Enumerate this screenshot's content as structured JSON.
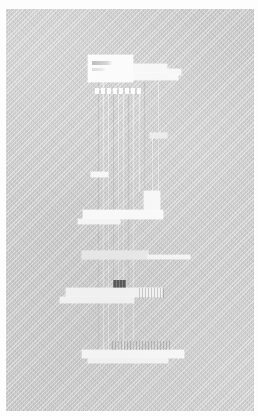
{
  "app": {
    "title": "",
    "view_mode": "canvas",
    "canvas_label": "",
    "background_color": "#c9c9c9",
    "panel_color": "#f7f7f7",
    "selection_color": "#4c4c4c",
    "margin_color": "#ffffff"
  },
  "canvas": {
    "zoom": "",
    "connector_color": "#ffffff",
    "note": ""
  },
  "nodes": [
    {
      "id": "node-top",
      "name": "primary-panel",
      "label": "",
      "title_text": "",
      "state": "normal",
      "x": 88,
      "y": 55,
      "w": 45,
      "h": 27
    },
    {
      "id": "node-top-wing-a",
      "name": "primary-panel-extension-a",
      "label": "",
      "state": "normal",
      "x": 133,
      "y": 64,
      "w": 34,
      "h": 9
    },
    {
      "id": "node-top-wing-b",
      "name": "primary-panel-extension-b",
      "label": "",
      "state": "normal",
      "x": 133,
      "y": 73,
      "w": 45,
      "h": 7
    },
    {
      "id": "node-top-wing-c",
      "name": "primary-panel-extension-c",
      "label": "",
      "state": "normal",
      "x": 167,
      "y": 69,
      "w": 14,
      "h": 6
    },
    {
      "id": "node-top-labels",
      "name": "primary-panel-label-row",
      "label": "",
      "state": "normal",
      "x": 95,
      "y": 88,
      "w": 48,
      "h": 6
    },
    {
      "id": "node-tag-mid",
      "name": "floating-tag",
      "label": "",
      "state": "normal",
      "x": 150,
      "y": 133,
      "w": 17,
      "h": 5
    },
    {
      "id": "node-tag-left",
      "name": "secondary-tag",
      "label": "",
      "state": "normal",
      "x": 91,
      "y": 172,
      "w": 17,
      "h": 5
    },
    {
      "id": "node-stack-tower",
      "name": "stacked-panel-tower",
      "label": "",
      "state": "normal",
      "x": 144,
      "y": 191,
      "w": 16,
      "h": 22
    },
    {
      "id": "node-stack-bar",
      "name": "stacked-panel-bar",
      "label": "",
      "state": "normal",
      "x": 83,
      "y": 210,
      "w": 80,
      "h": 9
    },
    {
      "id": "node-stack-foot",
      "name": "stacked-panel-footer",
      "label": "",
      "state": "normal",
      "x": 78,
      "y": 219,
      "w": 42,
      "h": 5
    },
    {
      "id": "node-wide-upper",
      "name": "wide-panel-upper",
      "label": "",
      "state": "normal",
      "x": 82,
      "y": 251,
      "w": 66,
      "h": 8
    },
    {
      "id": "node-wide-upper-tail",
      "name": "wide-panel-upper-tail",
      "label": "",
      "state": "normal",
      "x": 148,
      "y": 255,
      "w": 42,
      "h": 4
    },
    {
      "id": "node-selected-badge",
      "name": "selected-node-badge",
      "label": "",
      "state": "selected",
      "x": 113,
      "y": 280,
      "w": 13,
      "h": 8
    },
    {
      "id": "node-wide-lower",
      "name": "wide-panel-lower",
      "label": "",
      "state": "normal",
      "x": 66,
      "y": 288,
      "w": 96,
      "h": 9
    },
    {
      "id": "node-wide-lower-foot",
      "name": "wide-panel-lower-footer",
      "label": "",
      "state": "normal",
      "x": 60,
      "y": 297,
      "w": 74,
      "h": 6
    },
    {
      "id": "node-grid-right",
      "name": "grid-cell-group",
      "label": "",
      "state": "normal",
      "x": 139,
      "y": 288,
      "w": 26,
      "h": 10
    },
    {
      "id": "node-bottom-bar",
      "name": "bottom-panel-bar",
      "label": "",
      "state": "normal",
      "x": 82,
      "y": 350,
      "w": 102,
      "h": 8
    },
    {
      "id": "node-bottom-foot",
      "name": "bottom-panel-footer",
      "label": "",
      "state": "normal",
      "x": 88,
      "y": 358,
      "w": 80,
      "h": 5
    },
    {
      "id": "node-bottom-grid",
      "name": "bottom-grid-group",
      "label": "",
      "state": "normal",
      "x": 112,
      "y": 341,
      "w": 60,
      "h": 9
    }
  ],
  "connectors": [
    {
      "name": "connector-1",
      "x": 98,
      "y": 82,
      "h": 270
    },
    {
      "name": "connector-2",
      "x": 103,
      "y": 82,
      "h": 270
    },
    {
      "name": "connector-3",
      "x": 108,
      "y": 94,
      "h": 258
    },
    {
      "name": "connector-4",
      "x": 113,
      "y": 94,
      "h": 186
    },
    {
      "name": "connector-5",
      "x": 118,
      "y": 94,
      "h": 258
    },
    {
      "name": "connector-6",
      "x": 123,
      "y": 94,
      "h": 258
    },
    {
      "name": "connector-7",
      "x": 128,
      "y": 94,
      "h": 196
    },
    {
      "name": "connector-8",
      "x": 133,
      "y": 94,
      "h": 258
    },
    {
      "name": "connector-9",
      "x": 139,
      "y": 94,
      "h": 98
    },
    {
      "name": "connector-10",
      "x": 144,
      "y": 82,
      "h": 110
    },
    {
      "name": "connector-11",
      "x": 152,
      "y": 138,
      "h": 54
    },
    {
      "name": "connector-12",
      "x": 158,
      "y": 82,
      "h": 110
    }
  ]
}
